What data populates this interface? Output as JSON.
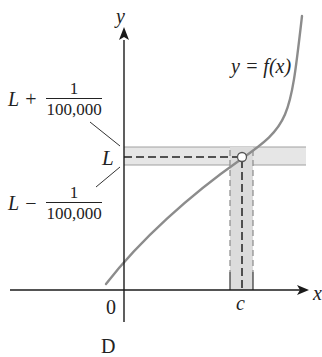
{
  "diagram": {
    "y_axis_label": "y",
    "x_axis_label": "x",
    "origin_label": "0",
    "c_label": "c",
    "curve_label": "y = f(x)",
    "L_label": "L",
    "upper_bound": {
      "base": "L",
      "op": "+",
      "num": "1",
      "den": "100,000"
    },
    "lower_bound": {
      "base": "L",
      "op": "−",
      "num": "1",
      "den": "100,000"
    },
    "caption_partial": "D",
    "colors": {
      "axis": "#1a1a1a",
      "curve": "#8c8c8c",
      "band_fill": "#e6e6e6",
      "band_edge": "#9a9a9a",
      "dashed": "#222222",
      "open_point_fill": "#ffffff"
    }
  }
}
